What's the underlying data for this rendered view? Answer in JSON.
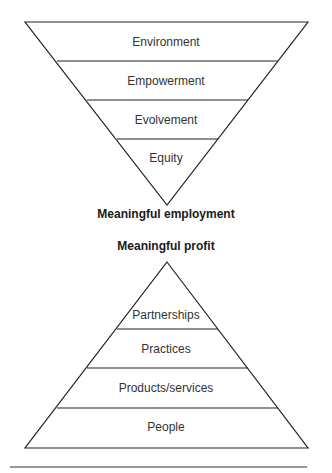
{
  "diagram": {
    "top_triangle": {
      "orientation": "inverted",
      "layers": [
        "Environment",
        "Empowerment",
        "Evolvement",
        "Equity"
      ],
      "apex_label": "Meaningful employment"
    },
    "bottom_triangle": {
      "orientation": "upright",
      "apex_label": "Meaningful profit",
      "layers": [
        "Partnerships",
        "Practices",
        "Products/services",
        "People"
      ]
    },
    "colors": {
      "line": "#222222",
      "text": "#333333",
      "background": "#ffffff"
    }
  }
}
